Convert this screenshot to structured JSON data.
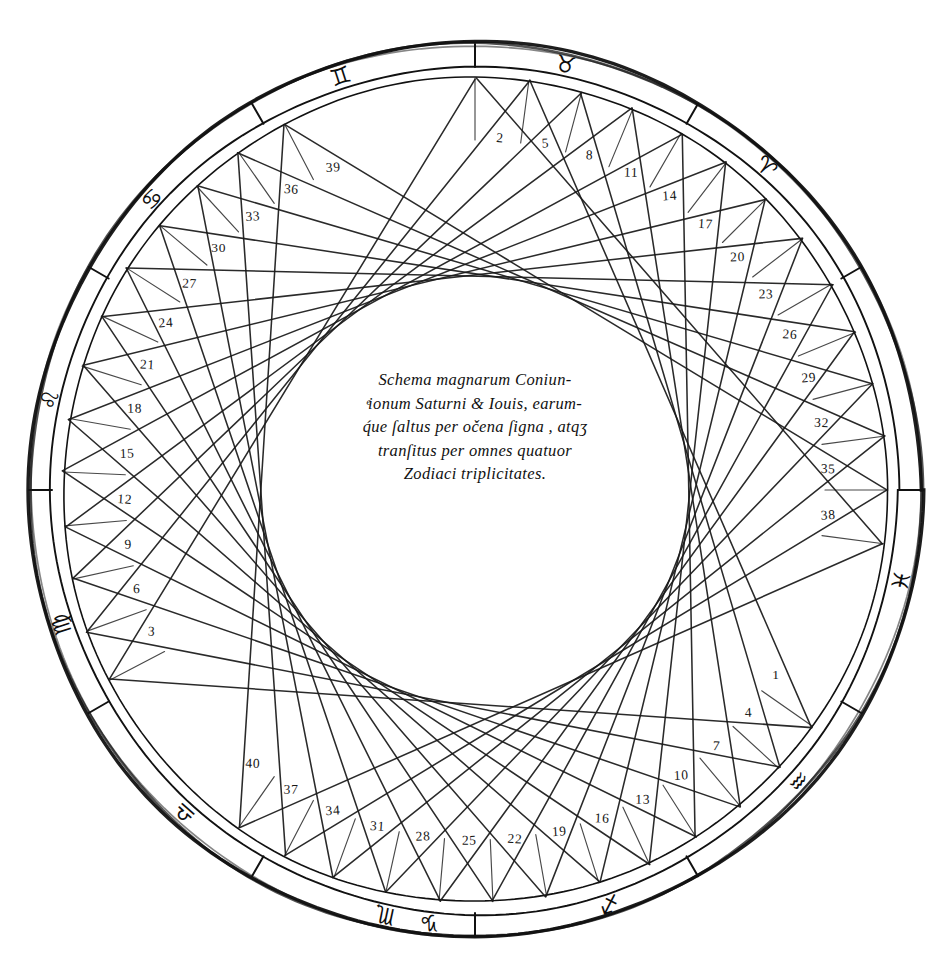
{
  "figure": {
    "caption_lines": [
      "Schema magnarum Coniun-",
      "ͤionum Saturni & Iouis, earum‐",
      "q́ue ſaltus per očena ſigna , atqʒ",
      "tranſitus per omnes quatuor",
      "Zodiaci triplicitates."
    ],
    "geometry": {
      "center_x": 475,
      "center_y": 490,
      "outer_radius": 447,
      "band_inner_radius": 424,
      "wheel_radius": 412,
      "label_radius": 352,
      "inner_envelope_radius": 213,
      "conjunction_count": 40,
      "step_degrees": 242.5,
      "start_angle_deg": -90
    },
    "colors": {
      "ink": "#161616",
      "paper": "#ffffff",
      "line": "#1a1a1a"
    }
  },
  "conjunction_numbers": [
    1,
    2,
    3,
    4,
    5,
    6,
    7,
    8,
    9,
    10,
    11,
    12,
    13,
    14,
    15,
    16,
    17,
    18,
    19,
    20,
    21,
    22,
    23,
    24,
    25,
    26,
    27,
    28,
    29,
    30,
    31,
    32,
    33,
    34,
    35,
    36,
    37,
    38,
    39,
    40
  ],
  "zodiac": {
    "signs": [
      {
        "name": "aries",
        "glyph": "♈",
        "angle_deg": -48
      },
      {
        "name": "taurus",
        "glyph": "♉",
        "angle_deg": -78
      },
      {
        "name": "gemini",
        "glyph": "♊",
        "angle_deg": -108
      },
      {
        "name": "cancer",
        "glyph": "♋",
        "angle_deg": -138
      },
      {
        "name": "leo",
        "glyph": "♌",
        "angle_deg": -168
      },
      {
        "name": "virgo",
        "glyph": "♍",
        "angle_deg": 162
      },
      {
        "name": "libra",
        "glyph": "♎",
        "angle_deg": 132
      },
      {
        "name": "scorpio",
        "glyph": "♏",
        "angle_deg": 102
      },
      {
        "name": "sagittarius",
        "glyph": "♐",
        "angle_deg": 72
      },
      {
        "name": "capricorn",
        "glyph": "♑",
        "angle_deg": 96
      },
      {
        "name": "aquarius",
        "glyph": "♒",
        "angle_deg": 42
      },
      {
        "name": "pisces",
        "glyph": "♓",
        "angle_deg": 12
      }
    ]
  }
}
